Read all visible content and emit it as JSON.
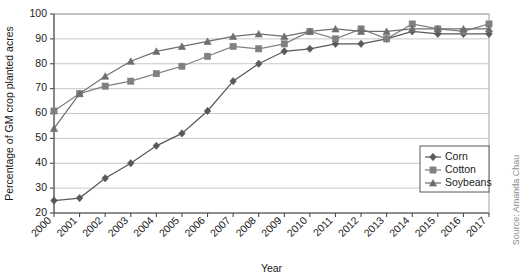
{
  "chart_data": {
    "type": "line",
    "title": "",
    "xlabel": "Year",
    "ylabel": "Percentage of GM crop planted acres",
    "categories": [
      "2000",
      "2001",
      "2002",
      "2003",
      "2004",
      "2005",
      "2006",
      "2007",
      "2008",
      "2009",
      "2010",
      "2011",
      "2012",
      "2013",
      "2014",
      "2015",
      "2016",
      "2017"
    ],
    "xlim": [
      2000,
      2017
    ],
    "ylim": [
      20,
      100
    ],
    "ytick_labels": [
      "20",
      "30",
      "40",
      "50",
      "60",
      "70",
      "80",
      "90",
      "100"
    ],
    "yticks": [
      20,
      30,
      40,
      50,
      60,
      70,
      80,
      90,
      100
    ],
    "grid": "horizontal",
    "legend_position": "bottom-right",
    "series": [
      {
        "name": "Corn",
        "marker": "diamond",
        "color": "#595959",
        "values": [
          25,
          26,
          34,
          40,
          47,
          52,
          61,
          73,
          80,
          85,
          86,
          88,
          88,
          90,
          93,
          92,
          92,
          92
        ]
      },
      {
        "name": "Cotton",
        "marker": "square",
        "color": "#808080",
        "values": [
          61,
          68,
          71,
          73,
          76,
          79,
          83,
          87,
          86,
          88,
          93,
          90,
          94,
          90,
          96,
          94,
          93,
          96
        ]
      },
      {
        "name": "Soybeans",
        "marker": "triangle",
        "color": "#6e6e6e",
        "values": [
          54,
          68,
          75,
          81,
          85,
          87,
          89,
          91,
          92,
          91,
          93,
          94,
          93,
          93,
          94,
          94,
          94,
          94
        ]
      }
    ],
    "source": "Source: Amanda Chau"
  },
  "legend": {
    "entries": [
      "Corn",
      "Cotton",
      "Soybeans"
    ]
  }
}
